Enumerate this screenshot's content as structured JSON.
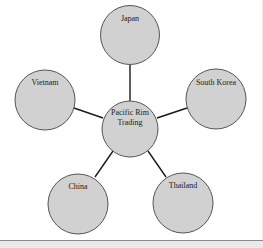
{
  "diagram": {
    "type": "hub-and-spoke",
    "colors": {
      "node_fill": "#d1d1d1",
      "node_stroke": "#555555",
      "connector": "#1a1a1a",
      "background": "#ffffff",
      "bottom_bar": "#e9e9e9"
    },
    "hub": {
      "label": "Pacific Rim Trading",
      "line1": "Pacific Rim",
      "line2": "Trading"
    },
    "nodes": [
      {
        "label": "Japan"
      },
      {
        "label": "South Korea"
      },
      {
        "label": "Thailand"
      },
      {
        "label": "China"
      },
      {
        "label": "Vietnam"
      }
    ]
  }
}
